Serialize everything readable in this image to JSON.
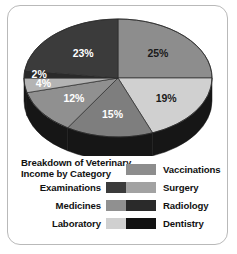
{
  "chart_data": {
    "type": "pie",
    "title": "Breakdown of Veterinary Income by Category",
    "title_line1": "Breakdown of Veterinary",
    "title_line2": "Income by Category",
    "categories": [
      "Vaccinations",
      "Laboratory",
      "Surgery",
      "Medicines",
      "Dentistry",
      "Radiology",
      "Examinations"
    ],
    "values": [
      25,
      19,
      15,
      12,
      4,
      2,
      23
    ],
    "labels": [
      "25%",
      "19%",
      "15%",
      "12%",
      "4%",
      "2%",
      "23%"
    ],
    "colors": [
      "#8d8d8d",
      "#d0d0d0",
      "#7e7e7e",
      "#909090",
      "#b4b4b4",
      "#2a2a2a",
      "#3b3b3b"
    ],
    "label_colors": [
      "#1a1a1a",
      "#1a1a1a",
      "#ffffff",
      "#ffffff",
      "#ffffff",
      "#ffffff",
      "#ffffff"
    ],
    "legend_position": "bottom",
    "three_d": true,
    "side_color": "#161616",
    "xlabel": "",
    "ylabel": ""
  },
  "legend": {
    "title_line1": "Breakdown of Veterinary",
    "title_line2": "Income by Category",
    "left_column": [
      {
        "label": "Examinations",
        "color": "#3b3b3b"
      },
      {
        "label": "Medicines",
        "color": "#909090"
      },
      {
        "label": "Laboratory",
        "color": "#d0d0d0"
      }
    ],
    "right_column": [
      {
        "label": "Vaccinations",
        "color": "#8d8d8d"
      },
      {
        "label": "Surgery",
        "color": "#a2a2a2"
      },
      {
        "label": "Radiology",
        "color": "#2a2a2a"
      },
      {
        "label": "Dentistry",
        "color": "#121212"
      }
    ]
  },
  "frame": {
    "border_color": "#b9b9b9",
    "background": "#ffffff"
  }
}
